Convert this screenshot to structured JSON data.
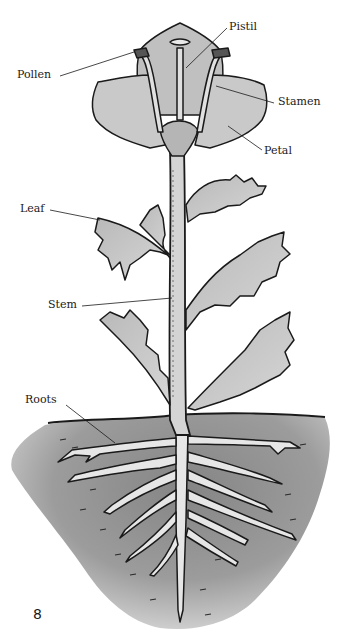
{
  "diagram": {
    "labels": {
      "pistil": "Pistil",
      "pollen": "Pollen",
      "stamen": "Stamen",
      "petal": "Petal",
      "leaf": "Leaf",
      "stem": "Stem",
      "roots": "Roots"
    },
    "page_number": "8"
  },
  "colors": {
    "ink": "#1a1a1a",
    "plant_fill": "#c8c8c8",
    "plant_dark": "#9a9a9a",
    "soil": "#8f8f8f",
    "soil_light": "#c4c4c4",
    "root_fill": "#e6e6e6"
  }
}
